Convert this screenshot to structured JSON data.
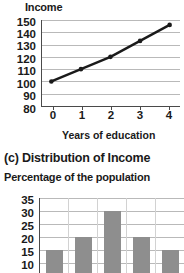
{
  "line_section": {
    "title": "Income",
    "xaxis_title": "Years of education"
  },
  "bar_section": {
    "title": "(c) Distribution of Income",
    "subtitle": "Percentage of the population"
  },
  "colors": {
    "ink": "#1a1a1a",
    "axis": "#4a4a4a",
    "gridline": "#b9b9b9",
    "bar_fill": "#8e8e8e",
    "bar_divider": "#d2d2d2",
    "background": "#ffffff"
  },
  "chart_data": [
    {
      "type": "line",
      "title": "Income",
      "xlabel": "Years of education",
      "ylabel": "Income",
      "x": [
        0,
        1,
        2,
        3,
        4
      ],
      "values": [
        100,
        110,
        120,
        133,
        146
      ],
      "xticklabels": [
        "0",
        "1",
        "2",
        "3",
        "4"
      ],
      "yticklabels": [
        "80",
        "90",
        "100",
        "110",
        "120",
        "130",
        "140",
        "150"
      ],
      "ylim": [
        80,
        150
      ],
      "xlim": [
        -0.35,
        4.35
      ],
      "ytick_step": 10,
      "grid": true,
      "legend": null,
      "markers": "filled-circle",
      "line_color": "#1a1a1a"
    },
    {
      "type": "bar",
      "title": "(c) Distribution of Income",
      "subtitle": "Percentage of the population",
      "xlabel": "",
      "ylabel": "Percentage of the population",
      "categories": [
        "1",
        "2",
        "3",
        "4",
        "5"
      ],
      "values": [
        15,
        20,
        30,
        20,
        15
      ],
      "yticklabels": [
        "10",
        "15",
        "20",
        "25",
        "30",
        "35"
      ],
      "ylim": [
        8,
        36
      ],
      "ytick_step": 5,
      "grid": true,
      "legend": null,
      "cropped": true,
      "bar_color": "#8e8e8e"
    }
  ]
}
